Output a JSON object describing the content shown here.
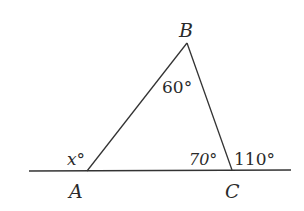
{
  "diagram": {
    "type": "triangle-exterior-angle",
    "colors": {
      "stroke": "#333333",
      "text": "#2a2a2a",
      "background": "#ffffff"
    },
    "vertices": {
      "A": {
        "label": "A"
      },
      "B": {
        "label": "B"
      },
      "C": {
        "label": "C"
      }
    },
    "angles": {
      "at_A_exterior": "x°",
      "at_B": "60°",
      "at_C_interior": "70°",
      "at_C_exterior": "110°"
    }
  }
}
